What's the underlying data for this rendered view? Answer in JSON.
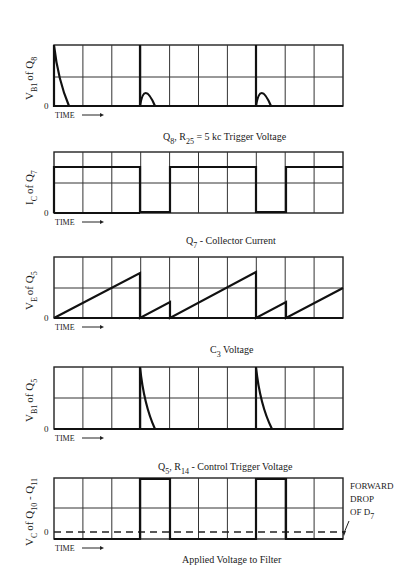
{
  "figure": {
    "grid": {
      "x0": 54,
      "x1": 343,
      "columns": 10
    },
    "time_label": "TIME",
    "zero_label": "0"
  },
  "panels": [
    {
      "id": "vb1-q8",
      "ylabel_main": "V",
      "ylabel_sub": "B1",
      "ylabel_of": "of Q",
      "ylabel_of_sub": "8",
      "top": 45,
      "mid": 77,
      "bottom": 106,
      "caption_main": "Q",
      "caption_sub": "8",
      "caption_rest1": ",  R",
      "caption_sub2": "25",
      "caption_rest2": " = 5 kc Trigger Voltage"
    },
    {
      "id": "ic-q7",
      "ylabel_main": "I",
      "ylabel_sub": "C",
      "ylabel_of": "of Q",
      "ylabel_of_sub": "7",
      "top": 152,
      "mid": 183,
      "bottom": 213,
      "caption_main": "Q",
      "caption_sub": "7",
      "caption_rest1": " - Collector Current",
      "caption_sub2": "",
      "caption_rest2": ""
    },
    {
      "id": "ve-q5",
      "ylabel_main": "V",
      "ylabel_sub": "E",
      "ylabel_of": "of Q",
      "ylabel_of_sub": "5",
      "top": 257,
      "mid": 288,
      "bottom": 318,
      "caption_main": "C",
      "caption_sub": "3",
      "caption_rest1": " Voltage",
      "caption_sub2": "",
      "caption_rest2": ""
    },
    {
      "id": "vb1-q5",
      "ylabel_main": "V",
      "ylabel_sub": "B1",
      "ylabel_of": "of Q",
      "ylabel_of_sub": "5",
      "top": 367,
      "mid": 398,
      "bottom": 429,
      "caption_main": "Q",
      "caption_sub": "5",
      "caption_rest1": ", R",
      "caption_sub2": "14",
      "caption_rest2": " - Control Trigger Voltage"
    },
    {
      "id": "vc-q10-q11",
      "ylabel_main": "V",
      "ylabel_sub": "C",
      "ylabel_of": "of Q",
      "ylabel_of_sub": "10",
      "ylabel_tail": " - Q",
      "ylabel_tail_sub": "11",
      "top": 478,
      "mid": 508,
      "bottom": 539,
      "zero": 532,
      "caption_main": "Applied Voltage to Filter",
      "caption_sub": "",
      "caption_rest1": "",
      "caption_sub2": "",
      "caption_rest2": "",
      "annotation": {
        "line1": "FORWARD",
        "line2": "DROP",
        "line3": "OF D",
        "line3_sub": "7"
      }
    }
  ],
  "chart_data": [
    {
      "type": "line",
      "title": "Q8, R25 = 5 kc Trigger Voltage",
      "ylabel": "V_B1 of Q8",
      "xlabel": "TIME",
      "x_divisions": 10,
      "description": "Sharp spikes decaying exponentially to zero at divisions 0, 4, 8",
      "spike_positions_div": [
        0,
        4,
        8
      ],
      "spike_peak": 1.0,
      "decay_width_div": 0.45
    },
    {
      "type": "line",
      "title": "Q7 - Collector Current",
      "ylabel": "I_C of Q7",
      "xlabel": "TIME",
      "x_divisions": 10,
      "description": "Square wave: high level ~0.75 of full scale, drops to 0 during divisions 3-4 and 7-8",
      "segments": [
        {
          "from": 0,
          "to": 3,
          "level": 0.75
        },
        {
          "from": 3,
          "to": 4,
          "level": 0
        },
        {
          "from": 4,
          "to": 7,
          "level": 0.75
        },
        {
          "from": 7,
          "to": 8,
          "level": 0
        },
        {
          "from": 8,
          "to": 10,
          "level": 0.75
        }
      ]
    },
    {
      "type": "line",
      "title": "C3 Voltage",
      "ylabel": "V_E of Q5",
      "xlabel": "TIME",
      "x_divisions": 10,
      "description": "Sawtooth ramps with resets",
      "ramps": [
        {
          "from": 0,
          "to": 3,
          "peak": 0.73
        },
        {
          "from": 3,
          "to": 4,
          "peak": 0.26
        },
        {
          "from": 4,
          "to": 7,
          "peak": 0.75
        },
        {
          "from": 7,
          "to": 8,
          "peak": 0.26
        },
        {
          "from": 8,
          "to": 10,
          "peak": 0.5
        }
      ]
    },
    {
      "type": "line",
      "title": "Q5, R14 - Control Trigger Voltage",
      "ylabel": "V_B1 of Q5",
      "xlabel": "TIME",
      "x_divisions": 10,
      "description": "Spikes decaying to zero at divisions 3 and 7",
      "spike_positions_div": [
        3,
        7
      ],
      "spike_peak": 1.0,
      "decay_width_div": 0.55
    },
    {
      "type": "line",
      "title": "Applied Voltage to Filter",
      "ylabel": "V_C of Q10 - Q11",
      "xlabel": "TIME",
      "x_divisions": 10,
      "description": "Square wave: low slightly below zero (forward drop of D7), high at full scale during divisions 3-4 and 7-8",
      "segments": [
        {
          "from": 0,
          "to": 3,
          "level": -0.1
        },
        {
          "from": 3,
          "to": 4,
          "level": 1.0
        },
        {
          "from": 4,
          "to": 7,
          "level": -0.1
        },
        {
          "from": 7,
          "to": 8,
          "level": 1.0
        },
        {
          "from": 8,
          "to": 10,
          "level": -0.1
        }
      ],
      "zero_line": "dashed",
      "annotation": "FORWARD DROP OF D7"
    }
  ]
}
